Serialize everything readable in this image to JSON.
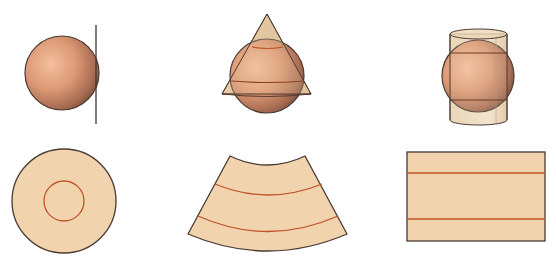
{
  "figure": {
    "colors": {
      "background": "#ffffff",
      "paper_fill": "#f1d3ad",
      "paper_fill_translucent": "#e9cfa6",
      "sphere_light": "#f2b592",
      "sphere_mid": "#d8906c",
      "sphere_dark": "#8a5a45",
      "outline": "#4a3b33",
      "parallel_line": "#c0532a"
    },
    "top_row": [
      {
        "id": "azimuthal",
        "surface": "plane",
        "label": ""
      },
      {
        "id": "conic",
        "surface": "cone",
        "label": ""
      },
      {
        "id": "cylindrical",
        "surface": "cylinder",
        "label": ""
      }
    ],
    "bottom_row": [
      {
        "id": "azimuthal-flat",
        "shape": "disc with inner circle",
        "label": ""
      },
      {
        "id": "conic-flat",
        "shape": "annular sector with two arcs",
        "label": ""
      },
      {
        "id": "cylindrical-flat",
        "shape": "rectangle with two horizontal lines",
        "label": ""
      }
    ]
  }
}
